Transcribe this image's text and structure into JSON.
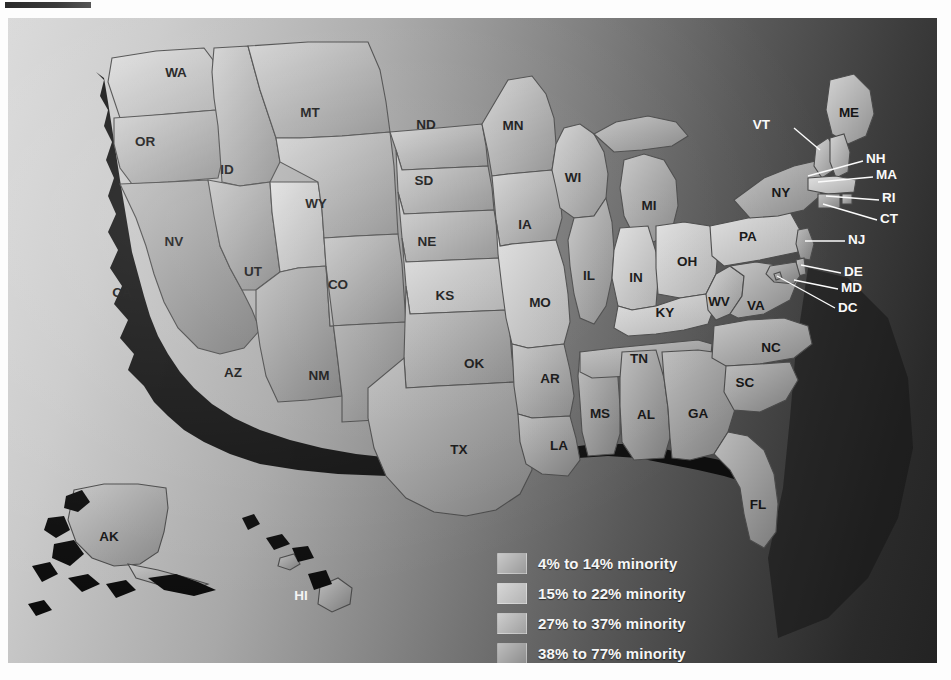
{
  "map": {
    "title": "United States minority population by state",
    "background_gradient": [
      "#d8d8d8",
      "#232323"
    ],
    "legend": {
      "items": [
        {
          "label": "4% to 14% minority",
          "color": "#c9c9c9",
          "color_to": "#9a9a9a",
          "bin": 1
        },
        {
          "label": "15% to 22% minority",
          "color": "#d6d6d6",
          "color_to": "#b4b4b4",
          "bin": 2
        },
        {
          "label": "27% to 37% minority",
          "color": "#cdcdcd",
          "color_to": "#a0a0a0",
          "bin": 3
        },
        {
          "label": "38% to 77% minority",
          "color": "#bdbdbd",
          "color_to": "#8e8e8e",
          "bin": 4
        }
      ]
    },
    "states": [
      {
        "code": "WA",
        "label_x": 168,
        "label_y": 55,
        "bin": 2,
        "label_color": "dark"
      },
      {
        "code": "OR",
        "label_x": 137,
        "label_y": 124,
        "bin": 1,
        "label_color": "dark"
      },
      {
        "code": "CA",
        "label_x": 114,
        "label_y": 275,
        "bin": 4,
        "label_color": "dark"
      },
      {
        "code": "ID",
        "label_x": 219,
        "label_y": 152,
        "bin": 1,
        "label_color": "dark"
      },
      {
        "code": "NV",
        "label_x": 166,
        "label_y": 224,
        "bin": 3,
        "label_color": "dark"
      },
      {
        "code": "UT",
        "label_x": 245,
        "label_y": 254,
        "bin": 2,
        "label_color": "dark"
      },
      {
        "code": "AZ",
        "label_x": 225,
        "label_y": 355,
        "bin": 4,
        "label_color": "dark"
      },
      {
        "code": "MT",
        "label_x": 302,
        "label_y": 95,
        "bin": 1,
        "label_color": "dark"
      },
      {
        "code": "WY",
        "label_x": 308,
        "label_y": 186,
        "bin": 1,
        "label_color": "dark"
      },
      {
        "code": "CO",
        "label_x": 330,
        "label_y": 267,
        "bin": 3,
        "label_color": "dark"
      },
      {
        "code": "NM",
        "label_x": 311,
        "label_y": 358,
        "bin": 4,
        "label_color": "dark"
      },
      {
        "code": "ND",
        "label_x": 418,
        "label_y": 107,
        "bin": 1,
        "label_color": "dark"
      },
      {
        "code": "SD",
        "label_x": 416,
        "label_y": 163,
        "bin": 1,
        "label_color": "dark"
      },
      {
        "code": "NE",
        "label_x": 419,
        "label_y": 224,
        "bin": 1,
        "label_color": "dark"
      },
      {
        "code": "KS",
        "label_x": 437,
        "label_y": 278,
        "bin": 2,
        "label_color": "dark"
      },
      {
        "code": "OK",
        "label_x": 466,
        "label_y": 346,
        "bin": 3,
        "label_color": "dark"
      },
      {
        "code": "TX",
        "label_x": 451,
        "label_y": 432,
        "bin": 4,
        "label_color": "dark"
      },
      {
        "code": "MN",
        "label_x": 505,
        "label_y": 108,
        "bin": 1,
        "label_color": "dark"
      },
      {
        "code": "IA",
        "label_x": 517,
        "label_y": 207,
        "bin": 1,
        "label_color": "dark"
      },
      {
        "code": "MO",
        "label_x": 532,
        "label_y": 285,
        "bin": 2,
        "label_color": "dark"
      },
      {
        "code": "AR",
        "label_x": 542,
        "label_y": 361,
        "bin": 3,
        "label_color": "dark"
      },
      {
        "code": "LA",
        "label_x": 551,
        "label_y": 428,
        "bin": 4,
        "label_color": "dark"
      },
      {
        "code": "WI",
        "label_x": 565,
        "label_y": 160,
        "bin": 1,
        "label_color": "dark"
      },
      {
        "code": "IL",
        "label_x": 581,
        "label_y": 258,
        "bin": 3,
        "label_color": "dark"
      },
      {
        "code": "MS",
        "label_x": 592,
        "label_y": 396,
        "bin": 4,
        "label_color": "dark"
      },
      {
        "code": "MI",
        "label_x": 641,
        "label_y": 188,
        "bin": 3,
        "label_color": "dark"
      },
      {
        "code": "IN",
        "label_x": 628,
        "label_y": 260,
        "bin": 2,
        "label_color": "dark"
      },
      {
        "code": "KY",
        "label_x": 657,
        "label_y": 295,
        "bin": 2,
        "label_color": "dark"
      },
      {
        "code": "TN",
        "label_x": 631,
        "label_y": 341,
        "bin": 3,
        "label_color": "dark"
      },
      {
        "code": "AL",
        "label_x": 638,
        "label_y": 397,
        "bin": 4,
        "label_color": "dark"
      },
      {
        "code": "GA",
        "label_x": 690,
        "label_y": 396,
        "bin": 4,
        "label_color": "dark"
      },
      {
        "code": "OH",
        "label_x": 679,
        "label_y": 244,
        "bin": 2,
        "label_color": "dark"
      },
      {
        "code": "WV",
        "label_x": 711,
        "label_y": 284,
        "bin": 1,
        "label_color": "dark"
      },
      {
        "code": "VA",
        "label_x": 748,
        "label_y": 288,
        "bin": 3,
        "label_color": "dark"
      },
      {
        "code": "NC",
        "label_x": 763,
        "label_y": 330,
        "bin": 3,
        "label_color": "dark"
      },
      {
        "code": "SC",
        "label_x": 737,
        "label_y": 365,
        "bin": 4,
        "label_color": "dark"
      },
      {
        "code": "FL",
        "label_x": 750,
        "label_y": 487,
        "bin": 4,
        "label_color": "dark"
      },
      {
        "code": "PA",
        "label_x": 740,
        "label_y": 219,
        "bin": 2,
        "label_color": "dark"
      },
      {
        "code": "NY",
        "label_x": 773,
        "label_y": 175,
        "bin": 3,
        "label_color": "dark"
      },
      {
        "code": "ME",
        "label_x": 841,
        "label_y": 95,
        "bin": 1,
        "label_color": "dark"
      },
      {
        "code": "AK",
        "label_x": 101,
        "label_y": 519,
        "bin": 3,
        "label_color": "dark"
      },
      {
        "code": "HI",
        "label_x": 293,
        "label_y": 578,
        "bin": 4,
        "label_color": "light"
      }
    ],
    "callouts": [
      {
        "code": "VT",
        "text_x": 762,
        "text_y": 107,
        "anchor": "end",
        "leader": "M 786 110 L 812 132",
        "bin": 1
      },
      {
        "code": "NH",
        "text_x": 858,
        "text_y": 141,
        "anchor": "start",
        "leader": "M 855 143 L 800 158",
        "bin": 1
      },
      {
        "code": "MA",
        "text_x": 868,
        "text_y": 157,
        "anchor": "start",
        "leader": "M 865 159 L 810 164",
        "bin": 2
      },
      {
        "code": "RI",
        "text_x": 874,
        "text_y": 180,
        "anchor": "start",
        "leader": "M 871 182 L 818 178",
        "bin": 3
      },
      {
        "code": "CT",
        "text_x": 872,
        "text_y": 201,
        "anchor": "start",
        "leader": "M 869 202 L 815 186",
        "bin": 3
      },
      {
        "code": "NJ",
        "text_x": 840,
        "text_y": 222,
        "anchor": "start",
        "leader": "M 837 223 L 797 223",
        "bin": 4
      },
      {
        "code": "DE",
        "text_x": 836,
        "text_y": 254,
        "anchor": "start",
        "leader": "M 833 255 L 793 247",
        "bin": 3
      },
      {
        "code": "MD",
        "text_x": 833,
        "text_y": 270,
        "anchor": "start",
        "leader": "M 830 271 L 786 262",
        "bin": 4
      },
      {
        "code": "DC",
        "text_x": 830,
        "text_y": 290,
        "anchor": "start",
        "leader": "M 827 290 L 769 258",
        "bin": 4
      }
    ]
  }
}
